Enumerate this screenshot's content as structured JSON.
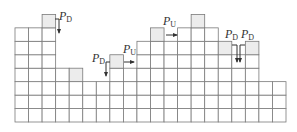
{
  "diagram": {
    "title": "",
    "grid": {
      "origin_x": 15,
      "bottom_y": 122,
      "cell_w": 13.55,
      "cell_h": 13.45,
      "columns": 20,
      "column_heights": [
        7,
        7,
        8,
        4,
        4,
        3,
        3,
        5,
        4,
        6,
        7,
        6,
        7,
        8,
        7,
        6,
        5,
        6,
        3,
        3
      ],
      "shaded_top_columns": [
        2,
        4,
        7,
        10,
        13,
        15,
        17
      ],
      "cell_color": "#ffffff",
      "shaded_color": "#ececec",
      "line_color": "#7a7a7a"
    },
    "labels": [
      {
        "id": "pd-1",
        "main": "P",
        "sub": "D",
        "x": 59,
        "y": 10
      },
      {
        "id": "pd-2",
        "main": "P",
        "sub": "D",
        "x": 92,
        "y": 52
      },
      {
        "id": "pu-1",
        "main": "P",
        "sub": "U",
        "x": 123,
        "y": 43
      },
      {
        "id": "pu-2",
        "main": "P",
        "sub": "U",
        "x": 163,
        "y": 15
      },
      {
        "id": "pd-3",
        "main": "P",
        "sub": "D",
        "x": 225,
        "y": 28
      },
      {
        "id": "pd-4",
        "main": "P",
        "sub": "D",
        "x": 241,
        "y": 28
      }
    ],
    "arrows": [
      {
        "id": "arrow-pd-1",
        "direction": "down",
        "points": [
          [
            55,
            19
          ],
          [
            59,
            19
          ],
          [
            59,
            33
          ]
        ]
      },
      {
        "id": "arrow-pd-2",
        "direction": "down",
        "points": [
          [
            110,
            62
          ],
          [
            106,
            62
          ],
          [
            106,
            76
          ]
        ]
      },
      {
        "id": "arrow-pu-1",
        "direction": "right",
        "points": [
          [
            124,
            62
          ],
          [
            134,
            62
          ]
        ]
      },
      {
        "id": "arrow-pu-2",
        "direction": "right",
        "points": [
          [
            166,
            35
          ],
          [
            177,
            35
          ]
        ]
      },
      {
        "id": "arrow-pd-3",
        "direction": "down",
        "points": [
          [
            232,
            45
          ],
          [
            237,
            45
          ],
          [
            237,
            62
          ]
        ]
      },
      {
        "id": "arrow-pd-4",
        "direction": "down",
        "points": [
          [
            245,
            45
          ],
          [
            240,
            45
          ],
          [
            240,
            62
          ]
        ]
      }
    ]
  }
}
